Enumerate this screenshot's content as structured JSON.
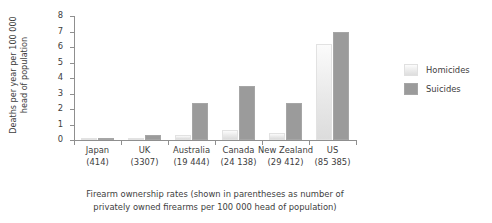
{
  "chart_data": {
    "type": "bar",
    "title": "",
    "xlabel": "Firearm ownership rates (shown in parentheses as number of privately owned firearms per 100 000 head of population)",
    "ylabel": "Deaths per year per 100 000 head of population",
    "categories": [
      "Japan",
      "UK",
      "Australia",
      "Canada",
      "New Zealand",
      "US"
    ],
    "category_sublabels": [
      "(414)",
      "(3307)",
      "(19 444)",
      "(24 138)",
      "(29 412)",
      "(85 385)"
    ],
    "series": [
      {
        "name": "Homicides",
        "color": "#ececec",
        "values": [
          0.05,
          0.15,
          0.3,
          0.62,
          0.45,
          6.2
        ]
      },
      {
        "name": "Suicides",
        "color": "#9b9b9b",
        "values": [
          0.15,
          0.35,
          2.4,
          3.5,
          2.4,
          7.0
        ]
      }
    ],
    "ylim": [
      0,
      8
    ],
    "yticks": [
      0,
      1,
      2,
      3,
      4,
      5,
      6,
      7,
      8
    ],
    "ytick_labels": [
      "0",
      "1",
      "2",
      "3",
      "4",
      "5",
      "6",
      "7",
      "8"
    ],
    "grid": false,
    "legend_position": "right"
  },
  "axis": {
    "y_title_line1": "Deaths per year per 100 000",
    "y_title_line2": "head of population"
  },
  "caption": {
    "line1": "Firearm ownership rates (shown in parentheses as number of",
    "line2": "privately owned firearms per 100 000 head of population)"
  }
}
